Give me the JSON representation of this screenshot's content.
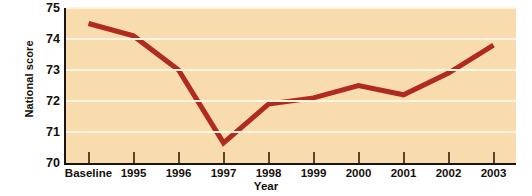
{
  "chart_data": {
    "type": "line",
    "title": "",
    "xlabel": "Year",
    "ylabel": "National score",
    "categories": [
      "Baseline",
      "1995",
      "1996",
      "1997",
      "1998",
      "1999",
      "2000",
      "2001",
      "2002",
      "2003"
    ],
    "values": [
      74.5,
      74.1,
      73.0,
      70.65,
      71.9,
      72.1,
      72.5,
      72.2,
      72.9,
      73.8
    ],
    "series": [
      {
        "name": "National score",
        "values": [
          74.5,
          74.1,
          73.0,
          70.65,
          71.9,
          72.1,
          72.5,
          72.2,
          72.9,
          73.8
        ]
      }
    ],
    "ylim": [
      70,
      75
    ],
    "yticks": [
      70,
      71,
      72,
      73,
      74,
      75
    ],
    "ytick_labels": [
      "70",
      "71",
      "72",
      "73",
      "74",
      "75"
    ],
    "xlim_categories": 10,
    "grid": true,
    "grid_axis": "y",
    "legend": false,
    "legend_position": "none",
    "colors": {
      "line": "#b02a1e",
      "plot_background": "#f8dcad",
      "gridline": "#fdf4e2",
      "axis": "#1a1512",
      "text": "#14100c",
      "page_background": "#ffffff"
    },
    "line_width": 5
  }
}
